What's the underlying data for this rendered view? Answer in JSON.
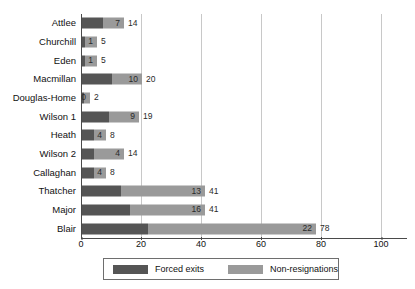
{
  "chart_data": {
    "type": "bar",
    "orientation": "horizontal",
    "stacked": true,
    "title": "",
    "xlabel": "",
    "ylabel": "",
    "xlim": [
      0,
      112
    ],
    "xticks": [
      0,
      20,
      40,
      60,
      80,
      100
    ],
    "gridlines": [
      20,
      40,
      60,
      80,
      100
    ],
    "grid": true,
    "legend_position": "bottom",
    "categories": [
      "Attlee",
      "Churchill",
      "Eden",
      "Macmillan",
      "Douglas-Home",
      "Wilson 1",
      "Heath",
      "Wilson 2",
      "Callaghan",
      "Thatcher",
      "Major",
      "Blair"
    ],
    "series": [
      {
        "name": "Forced exits",
        "color": "#555555",
        "values": [
          7,
          1,
          1,
          10,
          0,
          9,
          4,
          4,
          4,
          13,
          16,
          22
        ]
      },
      {
        "name": "Non-resignations",
        "color": "#9a9a9a",
        "values": [
          7,
          4,
          4,
          10,
          2,
          10,
          4,
          10,
          4,
          28,
          25,
          56
        ]
      }
    ],
    "totals": [
      14,
      5,
      5,
      20,
      2,
      19,
      8,
      14,
      8,
      41,
      41,
      78
    ],
    "segment_labels": [
      7,
      1,
      1,
      10,
      0,
      9,
      4,
      4,
      4,
      13,
      16,
      22
    ],
    "total_labels": [
      14,
      5,
      5,
      20,
      2,
      19,
      8,
      14,
      8,
      41,
      41,
      78
    ]
  },
  "legend": {
    "items": [
      {
        "label": "Forced exits",
        "color": "#555555"
      },
      {
        "label": "Non-resignations",
        "color": "#9a9a9a"
      }
    ]
  },
  "axis": {
    "tick_labels": [
      "0",
      "20",
      "40",
      "60",
      "80",
      "100"
    ]
  }
}
